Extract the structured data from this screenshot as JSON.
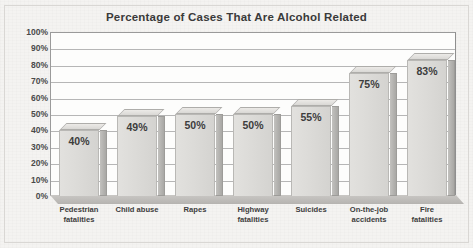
{
  "chart_data": {
    "type": "bar",
    "title": "Percentage of Cases That Are Alcohol Related",
    "xlabel": "",
    "ylabel": "",
    "ylim": [
      0,
      100
    ],
    "grid": true,
    "legend": "none",
    "categories": [
      "Pedestrian fatalities",
      "Child abuse",
      "Rapes",
      "Highway fatalities",
      "Suicides",
      "On-the-job accidents",
      "Fire fatalities"
    ],
    "category_lines": [
      [
        "Pedestrian",
        "fatalities"
      ],
      [
        "Child abuse",
        ""
      ],
      [
        "Rapes",
        ""
      ],
      [
        "Highway",
        "fatalities"
      ],
      [
        "Suicides",
        ""
      ],
      [
        "On-the-job",
        "accidents"
      ],
      [
        "Fire",
        "fatalities"
      ]
    ],
    "values": [
      40,
      49,
      50,
      50,
      55,
      75,
      83
    ],
    "value_labels": [
      "40%",
      "49%",
      "50%",
      "50%",
      "55%",
      "75%",
      "83%"
    ],
    "ytick_values": [
      100,
      90,
      80,
      70,
      60,
      50,
      40,
      30,
      20,
      10,
      0
    ],
    "ytick_labels": [
      "100%",
      "90%",
      "80%",
      "70%",
      "60%",
      "50%",
      "40%",
      "30%",
      "20%",
      "10%",
      "0%"
    ]
  },
  "colors": {
    "page_background": "#f4f3f1",
    "plot_background": "#fdfdfc",
    "bar_face": "#dcdbd8",
    "bar_side": "#b5b4b1",
    "bar_border": "#b9b8b5",
    "gridline": "#b6b6b6",
    "axis": "#9a9a9a",
    "text": "#3d3d3d",
    "title_text": "#3a3a3a"
  }
}
